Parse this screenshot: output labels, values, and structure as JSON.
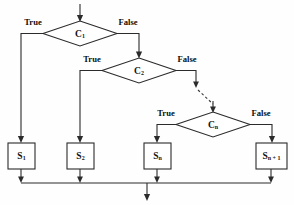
{
  "diagram": {
    "type": "flowchart",
    "background_color": "#fefefe",
    "line_color": "#2b2b2b",
    "text_color": "#111111",
    "entry": {
      "label": "",
      "arrow": "down-arrow-icon"
    },
    "decisions": [
      {
        "id": "c1",
        "label": "C",
        "subscript": "1",
        "true_label": "True",
        "false_label": "False",
        "true_target": "s1",
        "false_target": "c2"
      },
      {
        "id": "c2",
        "label": "C",
        "subscript": "2",
        "true_label": "True",
        "false_label": "False",
        "true_target": "s2",
        "false_target": "cn"
      },
      {
        "id": "cn",
        "label": "C",
        "subscript": "n",
        "true_label": "True",
        "false_label": "False",
        "true_target": "sn",
        "false_target": "sn1"
      }
    ],
    "processes": [
      {
        "id": "s1",
        "label": "S",
        "subscript": "1"
      },
      {
        "id": "s2",
        "label": "S",
        "subscript": "2"
      },
      {
        "id": "sn",
        "label": "S",
        "subscript": "n"
      },
      {
        "id": "sn1",
        "label": "S",
        "subscript": "n + 1"
      }
    ],
    "connector": {
      "style": "dashed",
      "meaning": "continuation-ellipsis",
      "from": "c2-false",
      "to": "cn"
    },
    "merge": {
      "style": "horizontal-bar",
      "exit_arrow": "down-arrow-icon"
    }
  }
}
